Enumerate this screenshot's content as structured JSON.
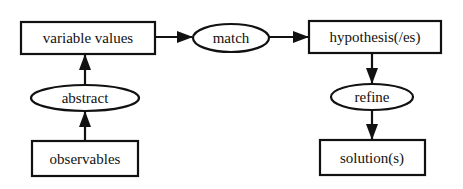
{
  "diagram": {
    "type": "flowchart",
    "nodes": [
      {
        "id": "variable_values",
        "label": "variable values",
        "shape": "rectangle"
      },
      {
        "id": "match",
        "label": "match",
        "shape": "ellipse"
      },
      {
        "id": "hypothesis",
        "label": "hypothesis(/es)",
        "shape": "rectangle"
      },
      {
        "id": "refine",
        "label": "refine",
        "shape": "ellipse"
      },
      {
        "id": "solutions",
        "label": "solution(s)",
        "shape": "rectangle"
      },
      {
        "id": "abstract",
        "label": "abstract",
        "shape": "ellipse"
      },
      {
        "id": "observables",
        "label": "observables",
        "shape": "rectangle"
      }
    ],
    "edges": [
      {
        "from": "observables",
        "to": "abstract"
      },
      {
        "from": "abstract",
        "to": "variable_values"
      },
      {
        "from": "variable_values",
        "to": "match"
      },
      {
        "from": "match",
        "to": "hypothesis"
      },
      {
        "from": "hypothesis",
        "to": "refine"
      },
      {
        "from": "refine",
        "to": "solutions"
      }
    ]
  },
  "labels": {
    "variable_values": "variable values",
    "match": "match",
    "hypothesis": "hypothesis(/es)",
    "refine": "refine",
    "solutions": "solution(s)",
    "abstract": "abstract",
    "observables": "observables"
  }
}
